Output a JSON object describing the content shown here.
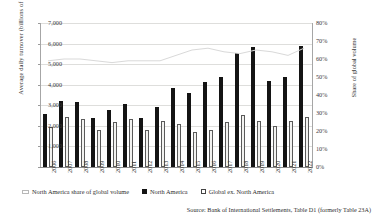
{
  "chart_data": {
    "type": "bar",
    "title": "",
    "xlabel": "",
    "ylabel": "Average daily turnover (billions of USD)",
    "y2label": "Share of global volume",
    "ylim": [
      0,
      7000
    ],
    "y2lim": [
      0,
      0.8
    ],
    "ytick_labels": [
      "7,000",
      "6,000",
      "5,000",
      "4,000",
      "3,000",
      "2,000",
      "1,000",
      "-"
    ],
    "ytick_values": [
      7000,
      6000,
      5000,
      4000,
      3000,
      2000,
      1000,
      0
    ],
    "y2tick_labels": [
      "80%",
      "70%",
      "60%",
      "50%",
      "40%",
      "30%",
      "20%",
      "10%",
      "0%"
    ],
    "y2tick_values": [
      80,
      70,
      60,
      50,
      40,
      30,
      20,
      10,
      0
    ],
    "grid": true,
    "legend_position": "bottom",
    "categories": [
      "2006",
      "2007",
      "2008",
      "2009",
      "2010",
      "2011",
      "2012",
      "2013",
      "2014",
      "2015",
      "2016",
      "2017",
      "2018",
      "2019",
      "2020",
      "2021",
      "2022"
    ],
    "series": [
      {
        "name": "North America",
        "type": "bar",
        "axis": "left",
        "color": "#141414",
        "values": [
          2600,
          3200,
          3150,
          2400,
          2750,
          3050,
          2400,
          2900,
          3850,
          3600,
          4150,
          4400,
          5550,
          5850,
          4200,
          4400,
          5900
        ]
      },
      {
        "name": "Global ex. North America",
        "type": "bar",
        "axis": "left",
        "color": "#ffffff",
        "values": [
          1950,
          2450,
          2350,
          1800,
          2200,
          2350,
          1800,
          2250,
          2100,
          1700,
          1800,
          2200,
          2550,
          2250,
          2000,
          2250,
          2450
        ]
      },
      {
        "name": "North America share of global volume",
        "type": "line",
        "axis": "right",
        "color": "#d9d9d9",
        "values": [
          59,
          60,
          60,
          59,
          58,
          59,
          59,
          59,
          62,
          65,
          66,
          64,
          63,
          65,
          64,
          62,
          66
        ]
      }
    ],
    "source": "Source: Bank of International Settlements, Table D1 (formerly Table 23A)"
  },
  "legend": {
    "items": [
      {
        "label": "North America share of global volume",
        "swatch": "line-swatch"
      },
      {
        "label": "North America",
        "swatch": "black-square-swatch"
      },
      {
        "label": "Global ex. North America",
        "swatch": "white-square-swatch"
      }
    ]
  }
}
